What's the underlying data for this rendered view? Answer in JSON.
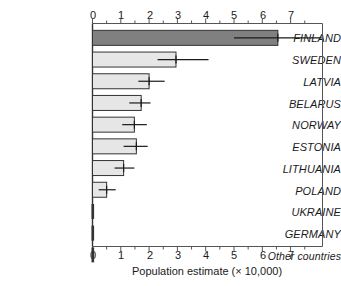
{
  "chart_data": {
    "type": "bar",
    "orientation": "horizontal",
    "title": "",
    "xlabel": "Population estimate (× 10,000)",
    "ylabel": "",
    "xlim": [
      0,
      8.1
    ],
    "xticks": [
      0,
      1,
      2,
      3,
      4,
      5,
      6,
      7
    ],
    "xtick_labels": [
      "0",
      "1",
      "2",
      "3",
      "4",
      "5",
      "6",
      "7"
    ],
    "minor_tick_step": 0.5,
    "grid": false,
    "legend": "none",
    "axis_position": "both-top-and-bottom",
    "categories": [
      "FINLAND",
      "SWEDEN",
      "LATVIA",
      "BELARUS",
      "NORWAY",
      "ESTONIA",
      "LITHUANIA",
      "POLAND",
      "UKRAINE",
      "GERMANY",
      "Other countries"
    ],
    "values": [
      6.55,
      2.95,
      2.0,
      1.72,
      1.48,
      1.55,
      1.1,
      0.5,
      0.0,
      0.0,
      0.0
    ],
    "error_low": [
      5.0,
      2.3,
      1.62,
      1.3,
      1.05,
      1.1,
      0.78,
      0.22,
      null,
      null,
      null
    ],
    "error_high": [
      8.1,
      4.1,
      2.55,
      2.05,
      1.92,
      1.95,
      1.48,
      0.82,
      null,
      null,
      null
    ],
    "bar_colors": [
      "#808080",
      "#e6e6e6",
      "#e6e6e6",
      "#e6e6e6",
      "#e6e6e6",
      "#e6e6e6",
      "#e6e6e6",
      "#e6e6e6",
      "#333333",
      "#333333",
      "#333333"
    ],
    "bar_edge_color": "#333333",
    "error_bar_color": "#1a1a1a",
    "frame_color": "#555555",
    "highlight_category": "FINLAND",
    "highlight_color": "#808080",
    "default_bar_color": "#e6e6e6"
  },
  "labels": {
    "cat_0": "FINLAND",
    "cat_1": "SWEDEN",
    "cat_2": "LATVIA",
    "cat_3": "BELARUS",
    "cat_4": "NORWAY",
    "cat_5": "ESTONIA",
    "cat_6": "LITHUANIA",
    "cat_7": "POLAND",
    "cat_8": "UKRAINE",
    "cat_9": "GERMANY",
    "cat_10": "Other countries"
  },
  "ticks": {
    "t0": "0",
    "t1": "1",
    "t2": "2",
    "t3": "3",
    "t4": "4",
    "t5": "5",
    "t6": "6",
    "t7": "7"
  },
  "axis": {
    "x_title": "Population estimate (× 10,000)"
  }
}
